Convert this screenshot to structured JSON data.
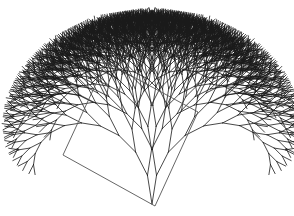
{
  "figure": {
    "width": 294,
    "height": 216,
    "background": "#ffffff"
  },
  "tree": {
    "root": [
      152,
      204
    ],
    "initial_angle_deg": -90,
    "trunk_length": 29,
    "branch_angle_deg": 18,
    "length_ratio": 0.9,
    "depth": 11,
    "stroke_color": "#1a1a1a",
    "stroke_width": 0.8
  },
  "rectangle": {
    "corners": [
      [
        155,
        206
      ],
      [
        63,
        155
      ],
      [
        106,
        62
      ],
      [
        198,
        112
      ]
    ],
    "stroke_color": "#555555"
  }
}
